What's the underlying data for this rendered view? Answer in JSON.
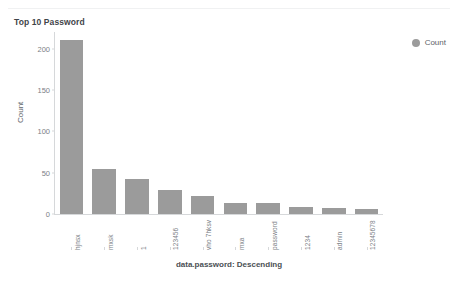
{
  "panel": {
    "title": "Top 10 Password"
  },
  "legend": {
    "position": "top-right",
    "swatch_name": "count-series-swatch",
    "swatch_color": "#9b9b9b",
    "label": "Count"
  },
  "chart_data": {
    "type": "bar",
    "title": "Top 10 Password",
    "xlabel": "data.password: Descending",
    "ylabel": "Count",
    "ylim": [
      0,
      220
    ],
    "grid": false,
    "legend_position": "top-right",
    "bar_color": "#9b9b9b",
    "series": [
      {
        "name": "Count",
        "values": [
          210,
          54,
          42,
          29,
          22,
          13,
          13,
          9,
          7,
          6
        ]
      }
    ],
    "categories": [
      "hjnsx",
      "mxsk",
      "1",
      "123456",
      "vho 7hksv",
      "mxa",
      "password",
      "1234",
      "admin",
      "12345678"
    ],
    "yticks": [
      0,
      50,
      100,
      150,
      200
    ],
    "ytick_labels": [
      "0",
      "50",
      "100",
      "150",
      "200"
    ]
  }
}
